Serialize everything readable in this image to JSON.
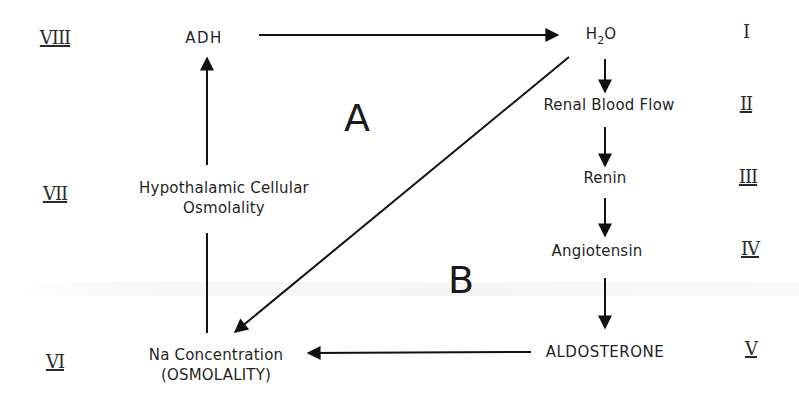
{
  "diagram": {
    "nodes": {
      "adh": "ADH",
      "h2o_main": "H",
      "h2o_sub": "2",
      "h2o_tail": "O",
      "renal_blood_flow": "Renal Blood Flow",
      "renin": "Renin",
      "angiotensin": "Angiotensin",
      "aldosterone": "ALDOSTERONE",
      "na_concentration_line1": "Na Concentration",
      "na_concentration_line2": "(OSMOLALITY)",
      "hypothalamic_line1": "Hypothalamic Cellular",
      "hypothalamic_line2": "Osmolality"
    },
    "regions": {
      "a": "A",
      "b": "B"
    },
    "step_numerals": {
      "i": "I",
      "ii": "II",
      "iii": "III",
      "iv": "IV",
      "v": "V",
      "vi": "VI",
      "vii": "VII",
      "viii": "VIII"
    },
    "edges": [
      {
        "from": "ADH",
        "to": "H2O"
      },
      {
        "from": "H2O",
        "to": "Renal Blood Flow"
      },
      {
        "from": "Renal Blood Flow",
        "to": "Renin"
      },
      {
        "from": "Renin",
        "to": "Angiotensin"
      },
      {
        "from": "Angiotensin",
        "to": "ALDOSTERONE"
      },
      {
        "from": "ALDOSTERONE",
        "to": "Na Concentration (OSMOLALITY)"
      },
      {
        "from": "H2O",
        "to": "Na Concentration (OSMOLALITY)"
      },
      {
        "from": "Na Concentration (OSMOLALITY)",
        "to": "Hypothalamic Cellular Osmolality"
      },
      {
        "from": "Hypothalamic Cellular Osmolality",
        "to": "ADH"
      }
    ]
  }
}
